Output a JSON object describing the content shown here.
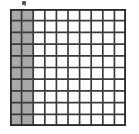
{
  "figure": {
    "artifact_label": "ink-speck"
  },
  "chart_data": {
    "type": "heatmap",
    "title": "",
    "subtitle": "",
    "xlabel": "",
    "ylabel": "",
    "grid": true,
    "legend": "none",
    "rows": 10,
    "columns": 10,
    "total_cells": 100,
    "shaded_cells": 20,
    "shaded_columns": [
      1,
      2
    ],
    "unshaded_cells": 80,
    "fraction_shaded": "20/100",
    "decimal_shaded": 0.2,
    "percent_shaded": 20,
    "categories": [
      "shaded",
      "unshaded"
    ],
    "values": [
      20,
      80
    ],
    "cell_fill_shaded": "#a9a9a9",
    "cell_fill_unshaded": "#ffffff",
    "grid_line_color": "#3b3b3b",
    "border_color": "#2a2a2a",
    "matrix": [
      [
        1,
        1,
        0,
        0,
        0,
        0,
        0,
        0,
        0,
        0
      ],
      [
        1,
        1,
        0,
        0,
        0,
        0,
        0,
        0,
        0,
        0
      ],
      [
        1,
        1,
        0,
        0,
        0,
        0,
        0,
        0,
        0,
        0
      ],
      [
        1,
        1,
        0,
        0,
        0,
        0,
        0,
        0,
        0,
        0
      ],
      [
        1,
        1,
        0,
        0,
        0,
        0,
        0,
        0,
        0,
        0
      ],
      [
        1,
        1,
        0,
        0,
        0,
        0,
        0,
        0,
        0,
        0
      ],
      [
        1,
        1,
        0,
        0,
        0,
        0,
        0,
        0,
        0,
        0
      ],
      [
        1,
        1,
        0,
        0,
        0,
        0,
        0,
        0,
        0,
        0
      ],
      [
        1,
        1,
        0,
        0,
        0,
        0,
        0,
        0,
        0,
        0
      ],
      [
        1,
        1,
        0,
        0,
        0,
        0,
        0,
        0,
        0,
        0
      ]
    ]
  }
}
